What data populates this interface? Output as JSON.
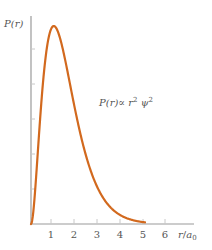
{
  "chart_data": {
    "type": "line",
    "title": "",
    "xlabel": "r/a0",
    "ylabel": "P(r)",
    "x_ticks": [
      "1",
      "2",
      "3",
      "4",
      "5",
      "6"
    ],
    "xlim": [
      0,
      7
    ],
    "ylim": [
      0,
      1
    ],
    "grid": false,
    "annotation": "P(r) ∝ r² ψ²",
    "series": [
      {
        "name": "P(r) ∝ r^2 psi^2",
        "color": "#d2691e",
        "formula": "r^2 * exp(-2r), normalized to peak 1",
        "x": [
          0,
          0.25,
          0.5,
          0.75,
          1.0,
          1.25,
          1.5,
          2.0,
          2.5,
          3.0,
          3.5,
          4.0,
          4.5,
          5.0
        ],
        "y": [
          0,
          0.29,
          0.68,
          0.93,
          1.0,
          0.95,
          0.84,
          0.59,
          0.37,
          0.22,
          0.12,
          0.066,
          0.034,
          0.017
        ]
      }
    ]
  },
  "labels": {
    "y_axis": "P(r)",
    "x_axis_r": "r",
    "x_axis_slash": "/",
    "x_axis_a": "a",
    "x_axis_sub": "0",
    "annotation_left": "P(r)∝ r",
    "annotation_sup1": "2",
    "annotation_psi": " ψ",
    "annotation_sup2": "2",
    "ticks": [
      "1",
      "2",
      "3",
      "4",
      "5",
      "6"
    ]
  },
  "colors": {
    "curve": "#d2691e",
    "axis": "#999999",
    "text": "#555555"
  }
}
